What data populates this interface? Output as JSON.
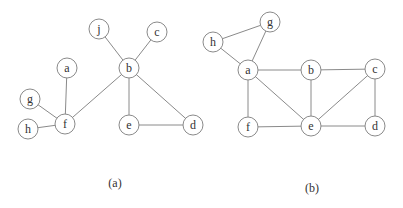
{
  "style": {
    "stroke": "#8a8a8a",
    "text": "#333333",
    "background": "#ffffff",
    "node_radius": 10
  },
  "graphs": [
    {
      "id": "a",
      "caption": "(a)",
      "caption_pos": [
        115,
        183
      ],
      "nodes": [
        {
          "id": "j",
          "label": "j",
          "x": 99,
          "y": 29
        },
        {
          "id": "c",
          "label": "c",
          "x": 157,
          "y": 32
        },
        {
          "id": "b",
          "label": "b",
          "x": 129,
          "y": 68
        },
        {
          "id": "a",
          "label": "a",
          "x": 67,
          "y": 68
        },
        {
          "id": "g",
          "label": "g",
          "x": 30,
          "y": 99
        },
        {
          "id": "f",
          "label": "f",
          "x": 65,
          "y": 124
        },
        {
          "id": "h",
          "label": "h",
          "x": 28,
          "y": 129
        },
        {
          "id": "e",
          "label": "e",
          "x": 129,
          "y": 125
        },
        {
          "id": "d",
          "label": "d",
          "x": 193,
          "y": 125
        }
      ],
      "edges": [
        [
          "j",
          "b"
        ],
        [
          "c",
          "b"
        ],
        [
          "b",
          "f"
        ],
        [
          "b",
          "e"
        ],
        [
          "b",
          "d"
        ],
        [
          "e",
          "d"
        ],
        [
          "a",
          "f"
        ],
        [
          "g",
          "f"
        ],
        [
          "h",
          "f"
        ]
      ]
    },
    {
      "id": "b",
      "caption": "(b)",
      "caption_pos": [
        312,
        188
      ],
      "nodes": [
        {
          "id": "g",
          "label": "g",
          "x": 270,
          "y": 22
        },
        {
          "id": "h",
          "label": "h",
          "x": 213,
          "y": 42
        },
        {
          "id": "a",
          "label": "a",
          "x": 248,
          "y": 70
        },
        {
          "id": "b",
          "label": "b",
          "x": 311,
          "y": 70
        },
        {
          "id": "c",
          "label": "c",
          "x": 375,
          "y": 69
        },
        {
          "id": "f",
          "label": "f",
          "x": 248,
          "y": 127
        },
        {
          "id": "e",
          "label": "e",
          "x": 311,
          "y": 126
        },
        {
          "id": "d",
          "label": "d",
          "x": 375,
          "y": 126
        }
      ],
      "edges": [
        [
          "h",
          "g"
        ],
        [
          "h",
          "a"
        ],
        [
          "g",
          "a"
        ],
        [
          "a",
          "b"
        ],
        [
          "b",
          "c"
        ],
        [
          "a",
          "f"
        ],
        [
          "a",
          "e"
        ],
        [
          "b",
          "e"
        ],
        [
          "c",
          "e"
        ],
        [
          "c",
          "d"
        ],
        [
          "f",
          "e"
        ],
        [
          "e",
          "d"
        ]
      ]
    }
  ]
}
